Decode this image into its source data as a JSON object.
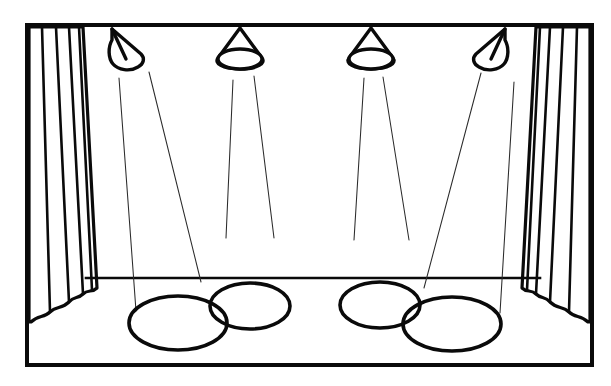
{
  "artwork": {
    "title": "Theater Stage with Spotlights",
    "description": "Black and white line drawing of an empty theater stage: a rectangular proscenium frame, pleated curtains drawn to the left and right, four hanging spotlights along the top batten casting thin beam lines, and four overlapping elliptical light pools on the stage floor.",
    "style": "black-ink line art, no fill, white background",
    "canvas": {
      "width": 611,
      "height": 386
    },
    "colors": {
      "background": "#ffffff",
      "ink": "#0a0a0a",
      "beam_ink": "#2b2b2b"
    }
  },
  "frame": {
    "name": "proscenium-frame",
    "x": 27,
    "y": 25,
    "width": 565,
    "height": 340,
    "stroke_width": 4
  },
  "floor": {
    "name": "stage-floor-edge",
    "label": "stage floor front edge",
    "y": 278,
    "x_start": 86,
    "x_end": 540
  },
  "curtains": [
    {
      "name": "curtain-left",
      "side": "left",
      "fold_count": 4,
      "hem": "scalloped",
      "top_x_start": 29,
      "top_x_end": 83,
      "bottom_x_start": 29,
      "bottom_x_end": 97
    },
    {
      "name": "curtain-right",
      "side": "right",
      "fold_count": 4,
      "hem": "scalloped",
      "top_x_start": 536,
      "top_x_end": 590,
      "bottom_x_start": 522,
      "bottom_x_end": 590
    }
  ],
  "spotlights": [
    {
      "name": "spotlight-1",
      "index": 1,
      "mount_x": 127,
      "tilt": "right",
      "tilt_degrees": 28,
      "beams": 2
    },
    {
      "name": "spotlight-2",
      "index": 2,
      "mount_x": 240,
      "tilt": "none",
      "tilt_degrees": 0,
      "beams": 2
    },
    {
      "name": "spotlight-3",
      "index": 3,
      "mount_x": 371,
      "tilt": "none",
      "tilt_degrees": 0,
      "beams": 2
    },
    {
      "name": "spotlight-4",
      "index": 4,
      "mount_x": 489,
      "tilt": "left",
      "tilt_degrees": -28,
      "beams": 2
    }
  ],
  "beams": [
    {
      "name": "beam-1a",
      "x1": 119,
      "y1": 78,
      "x2": 136,
      "y2": 311
    },
    {
      "name": "beam-1b",
      "x1": 149,
      "y1": 72,
      "x2": 201,
      "y2": 282
    },
    {
      "name": "beam-2a",
      "x1": 233,
      "y1": 80,
      "x2": 226,
      "y2": 238
    },
    {
      "name": "beam-2b",
      "x1": 254,
      "y1": 76,
      "x2": 274,
      "y2": 238
    },
    {
      "name": "beam-3a",
      "x1": 364,
      "y1": 78,
      "x2": 354,
      "y2": 240
    },
    {
      "name": "beam-3b",
      "x1": 383,
      "y1": 77,
      "x2": 409,
      "y2": 240
    },
    {
      "name": "beam-4a",
      "x1": 481,
      "y1": 73,
      "x2": 424,
      "y2": 288
    },
    {
      "name": "beam-4b",
      "x1": 514,
      "y1": 82,
      "x2": 500,
      "y2": 313
    }
  ],
  "light_pools": [
    {
      "name": "light-pool-1",
      "label": "large left pool",
      "cx": 178,
      "cy": 323,
      "rx": 49,
      "ry": 27,
      "size": "large"
    },
    {
      "name": "light-pool-2",
      "label": "small left pool",
      "cx": 250,
      "cy": 306,
      "rx": 40,
      "ry": 23,
      "size": "small"
    },
    {
      "name": "light-pool-3",
      "label": "small right pool",
      "cx": 380,
      "cy": 305,
      "rx": 40,
      "ry": 23,
      "size": "small"
    },
    {
      "name": "light-pool-4",
      "label": "large right pool",
      "cx": 452,
      "cy": 324,
      "rx": 49,
      "ry": 27,
      "size": "large"
    }
  ]
}
